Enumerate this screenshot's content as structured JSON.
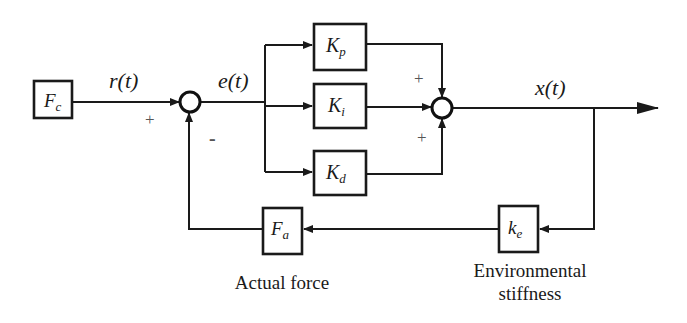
{
  "diagram": {
    "type": "control-block-diagram",
    "colors": {
      "line": "#1a1a1a",
      "background": "#ffffff",
      "sign": "#555555"
    },
    "blocks": {
      "fc": {
        "main": "F",
        "sub": "c"
      },
      "kp": {
        "main": "K",
        "sub": "p"
      },
      "ki": {
        "main": "K",
        "sub": "i"
      },
      "kd": {
        "main": "K",
        "sub": "d"
      },
      "fa": {
        "main": "F",
        "sub": "a"
      },
      "ke": {
        "main": "k",
        "sub": "e"
      }
    },
    "signals": {
      "reference": "r(t)",
      "error": "e(t)",
      "output": "x(t)"
    },
    "signs": {
      "sum1_reference": "+",
      "sum1_feedback": "-",
      "sum2_top": "+",
      "sum2_bottom": "+"
    },
    "captions": {
      "fa": "Actual force",
      "ke_line1": "Environmental",
      "ke_line2": "stiffness"
    }
  }
}
